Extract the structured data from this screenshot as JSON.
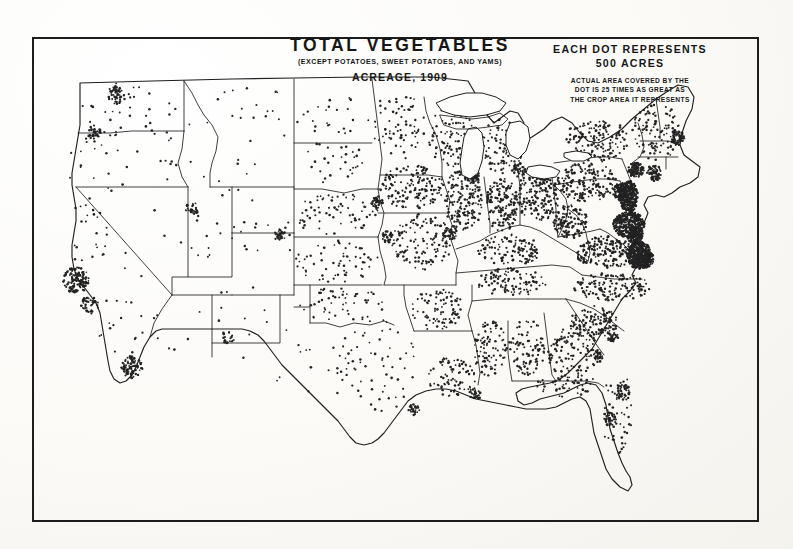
{
  "document": {
    "kind": "historical-dot-density-map",
    "title": "TOTAL VEGETABLES",
    "subtitle": "(EXCEPT POTATOES, SWEET POTATOES, AND YAMS)",
    "acreage_line": "ACREAGE, 1909"
  },
  "legend": {
    "head_line_1": "EACH DOT REPRESENTS",
    "head_line_2": "500 ACRES",
    "fine_line_1": "ACTUAL AREA COVERED BY THE",
    "fine_line_2": "DOT IS 25 TIMES AS GREAT AS",
    "fine_line_3": "THE CROP AREA IT REPRESENTS"
  },
  "colors": {
    "ink": "#1d1d1d",
    "paper": "#fdfdfb",
    "dot": "#232323",
    "state_line": "#1f1f1f"
  },
  "chart_data": {
    "type": "map",
    "unit": "acres",
    "dot_value": 500,
    "dot_area_exaggeration": 25,
    "regions": [
      {
        "name": "Washington",
        "cx": 88,
        "cy": 72,
        "rx": 38,
        "ry": 26,
        "density": 26,
        "jitter": 1.0
      },
      {
        "name": "Oregon",
        "cx": 70,
        "cy": 125,
        "rx": 40,
        "ry": 30,
        "density": 22,
        "jitter": 1.0
      },
      {
        "name": "Idaho",
        "cx": 140,
        "cy": 105,
        "rx": 22,
        "ry": 40,
        "density": 16,
        "jitter": 1.0
      },
      {
        "name": "Montana",
        "cx": 215,
        "cy": 78,
        "rx": 55,
        "ry": 30,
        "density": 18,
        "jitter": 1.0
      },
      {
        "name": "Wyoming",
        "cx": 210,
        "cy": 145,
        "rx": 40,
        "ry": 27,
        "density": 10,
        "jitter": 1.0
      },
      {
        "name": "North Dakota",
        "cx": 300,
        "cy": 80,
        "rx": 38,
        "ry": 24,
        "density": 24,
        "jitter": 1.0
      },
      {
        "name": "South Dakota",
        "cx": 300,
        "cy": 128,
        "rx": 38,
        "ry": 24,
        "density": 30,
        "jitter": 1.0
      },
      {
        "name": "Nebraska",
        "cx": 305,
        "cy": 178,
        "rx": 42,
        "ry": 22,
        "density": 70,
        "jitter": 1.0
      },
      {
        "name": "Kansas",
        "cx": 305,
        "cy": 225,
        "rx": 42,
        "ry": 22,
        "density": 62,
        "jitter": 1.0
      },
      {
        "name": "Minnesota",
        "cx": 368,
        "cy": 88,
        "rx": 28,
        "ry": 34,
        "density": 70,
        "jitter": 1.0
      },
      {
        "name": "Iowa",
        "cx": 380,
        "cy": 150,
        "rx": 32,
        "ry": 22,
        "density": 150,
        "jitter": 1.0
      },
      {
        "name": "Missouri",
        "cx": 390,
        "cy": 205,
        "rx": 30,
        "ry": 28,
        "density": 130,
        "jitter": 1.0
      },
      {
        "name": "Wisconsin",
        "cx": 420,
        "cy": 100,
        "rx": 24,
        "ry": 30,
        "density": 90,
        "jitter": 1.0
      },
      {
        "name": "Illinois",
        "cx": 432,
        "cy": 163,
        "rx": 20,
        "ry": 32,
        "density": 165,
        "jitter": 1.0
      },
      {
        "name": "Michigan-lower",
        "cx": 470,
        "cy": 110,
        "rx": 22,
        "ry": 28,
        "density": 95,
        "jitter": 1.0
      },
      {
        "name": "Indiana",
        "cx": 470,
        "cy": 168,
        "rx": 16,
        "ry": 28,
        "density": 150,
        "jitter": 1.0
      },
      {
        "name": "Ohio",
        "cx": 505,
        "cy": 160,
        "rx": 22,
        "ry": 25,
        "density": 170,
        "jitter": 1.0
      },
      {
        "name": "Kentucky",
        "cx": 478,
        "cy": 213,
        "rx": 32,
        "ry": 16,
        "density": 110,
        "jitter": 1.0
      },
      {
        "name": "Tennessee",
        "cx": 480,
        "cy": 245,
        "rx": 36,
        "ry": 14,
        "density": 105,
        "jitter": 1.0
      },
      {
        "name": "Pennsylvania",
        "cx": 555,
        "cy": 145,
        "rx": 30,
        "ry": 20,
        "density": 175,
        "jitter": 1.0
      },
      {
        "name": "New York",
        "cx": 565,
        "cy": 103,
        "rx": 32,
        "ry": 22,
        "density": 150,
        "jitter": 1.0
      },
      {
        "name": "New England",
        "cx": 625,
        "cy": 95,
        "rx": 25,
        "ry": 28,
        "density": 115,
        "jitter": 1.0
      },
      {
        "name": "New Jersey",
        "cx": 597,
        "cy": 160,
        "rx": 9,
        "ry": 16,
        "density": 330,
        "jitter": 0.9
      },
      {
        "name": "Delaware-Maryland",
        "cx": 597,
        "cy": 188,
        "rx": 16,
        "ry": 13,
        "density": 360,
        "jitter": 0.9
      },
      {
        "name": "Virginia",
        "cx": 575,
        "cy": 215,
        "rx": 32,
        "ry": 16,
        "density": 190,
        "jitter": 1.0
      },
      {
        "name": "Tidewater-Virginia",
        "cx": 607,
        "cy": 218,
        "rx": 12,
        "ry": 14,
        "density": 400,
        "jitter": 0.9
      },
      {
        "name": "West Virginia",
        "cx": 538,
        "cy": 185,
        "rx": 18,
        "ry": 17,
        "density": 120,
        "jitter": 1.0
      },
      {
        "name": "North Carolina",
        "cx": 580,
        "cy": 250,
        "rx": 38,
        "ry": 14,
        "density": 140,
        "jitter": 1.0
      },
      {
        "name": "South Carolina",
        "cx": 562,
        "cy": 285,
        "rx": 24,
        "ry": 16,
        "density": 120,
        "jitter": 1.0
      },
      {
        "name": "Georgia",
        "cx": 540,
        "cy": 315,
        "rx": 26,
        "ry": 26,
        "density": 115,
        "jitter": 1.0
      },
      {
        "name": "Alabama",
        "cx": 495,
        "cy": 310,
        "rx": 18,
        "ry": 28,
        "density": 95,
        "jitter": 1.0
      },
      {
        "name": "Mississippi",
        "cx": 458,
        "cy": 312,
        "rx": 17,
        "ry": 28,
        "density": 90,
        "jitter": 1.0
      },
      {
        "name": "Arkansas",
        "cx": 405,
        "cy": 272,
        "rx": 26,
        "ry": 22,
        "density": 90,
        "jitter": 1.0
      },
      {
        "name": "Louisiana",
        "cx": 420,
        "cy": 340,
        "rx": 25,
        "ry": 20,
        "density": 80,
        "jitter": 1.0
      },
      {
        "name": "Oklahoma",
        "cx": 310,
        "cy": 268,
        "rx": 42,
        "ry": 18,
        "density": 55,
        "jitter": 1.0
      },
      {
        "name": "Texas-east",
        "cx": 345,
        "cy": 330,
        "rx": 40,
        "ry": 48,
        "density": 60,
        "jitter": 1.0
      },
      {
        "name": "Texas-central",
        "cx": 295,
        "cy": 330,
        "rx": 30,
        "ry": 38,
        "density": 14,
        "jitter": 1.0
      },
      {
        "name": "Texas-west",
        "cx": 240,
        "cy": 320,
        "rx": 35,
        "ry": 30,
        "density": 5,
        "jitter": 1.0
      },
      {
        "name": "New Mexico",
        "cx": 215,
        "cy": 272,
        "rx": 32,
        "ry": 33,
        "density": 9,
        "jitter": 1.0
      },
      {
        "name": "Arizona",
        "cx": 150,
        "cy": 282,
        "rx": 30,
        "ry": 34,
        "density": 7,
        "jitter": 1.0
      },
      {
        "name": "Colorado",
        "cx": 232,
        "cy": 205,
        "rx": 38,
        "ry": 26,
        "density": 16,
        "jitter": 1.0
      },
      {
        "name": "Utah",
        "cx": 165,
        "cy": 200,
        "rx": 26,
        "ry": 32,
        "density": 11,
        "jitter": 1.0
      },
      {
        "name": "Nevada",
        "cx": 110,
        "cy": 205,
        "rx": 24,
        "ry": 40,
        "density": 5,
        "jitter": 1.0
      },
      {
        "name": "California-north",
        "cx": 56,
        "cy": 195,
        "rx": 22,
        "ry": 34,
        "density": 24,
        "jitter": 1.0
      },
      {
        "name": "California-south",
        "cx": 85,
        "cy": 290,
        "rx": 26,
        "ry": 34,
        "density": 16,
        "jitter": 1.0
      },
      {
        "name": "Florida-peninsula",
        "cx": 585,
        "cy": 375,
        "rx": 16,
        "ry": 45,
        "density": 45,
        "jitter": 1.0
      },
      {
        "name": "Florida-panhandle",
        "cx": 535,
        "cy": 348,
        "rx": 30,
        "ry": 12,
        "density": 50,
        "jitter": 1.0
      }
    ],
    "clusters": [
      {
        "name": "San Francisco Bay",
        "cx": 44,
        "cy": 243,
        "r": 13,
        "count": 130
      },
      {
        "name": "Los Angeles",
        "cx": 100,
        "cy": 330,
        "r": 11,
        "count": 95
      },
      {
        "name": "Sacramento Delta",
        "cx": 58,
        "cy": 268,
        "r": 9,
        "count": 45
      },
      {
        "name": "Puget Sound",
        "cx": 85,
        "cy": 58,
        "r": 9,
        "count": 55
      },
      {
        "name": "Portland",
        "cx": 62,
        "cy": 95,
        "r": 7,
        "count": 34
      },
      {
        "name": "Salt Lake",
        "cx": 160,
        "cy": 172,
        "r": 7,
        "count": 30
      },
      {
        "name": "Denver",
        "cx": 248,
        "cy": 198,
        "r": 6,
        "count": 26
      },
      {
        "name": "Rio Grande Valley",
        "cx": 196,
        "cy": 300,
        "r": 7,
        "count": 22
      },
      {
        "name": "Chicago",
        "cx": 441,
        "cy": 138,
        "r": 8,
        "count": 60
      },
      {
        "name": "Milwaukee",
        "cx": 432,
        "cy": 122,
        "r": 6,
        "count": 32
      },
      {
        "name": "Detroit",
        "cx": 487,
        "cy": 133,
        "r": 7,
        "count": 42
      },
      {
        "name": "Cleveland",
        "cx": 512,
        "cy": 142,
        "r": 6,
        "count": 38
      },
      {
        "name": "Omaha",
        "cx": 345,
        "cy": 165,
        "r": 6,
        "count": 34
      },
      {
        "name": "Kansas City",
        "cx": 355,
        "cy": 200,
        "r": 6,
        "count": 32
      },
      {
        "name": "St. Louis",
        "cx": 418,
        "cy": 196,
        "r": 7,
        "count": 40
      },
      {
        "name": "New Orleans",
        "cx": 443,
        "cy": 357,
        "r": 6,
        "count": 28
      },
      {
        "name": "Norfolk-Hampton",
        "cx": 613,
        "cy": 222,
        "r": 9,
        "count": 120
      },
      {
        "name": "Eastern Shore",
        "cx": 604,
        "cy": 200,
        "r": 8,
        "count": 110
      },
      {
        "name": "Philadelphia",
        "cx": 590,
        "cy": 155,
        "r": 9,
        "count": 115
      },
      {
        "name": "New York City",
        "cx": 604,
        "cy": 133,
        "r": 8,
        "count": 100
      },
      {
        "name": "Long Island",
        "cx": 622,
        "cy": 136,
        "r": 8,
        "count": 70
      },
      {
        "name": "Boston",
        "cx": 645,
        "cy": 100,
        "r": 7,
        "count": 55
      },
      {
        "name": "Charleston",
        "cx": 580,
        "cy": 300,
        "r": 6,
        "count": 30
      },
      {
        "name": "Savannah",
        "cx": 566,
        "cy": 320,
        "r": 5,
        "count": 24
      },
      {
        "name": "Tampa Bay",
        "cx": 577,
        "cy": 382,
        "r": 7,
        "count": 40
      },
      {
        "name": "Sanford Florida",
        "cx": 590,
        "cy": 355,
        "r": 8,
        "count": 48
      },
      {
        "name": "Galveston",
        "cx": 382,
        "cy": 372,
        "r": 6,
        "count": 26
      }
    ]
  }
}
